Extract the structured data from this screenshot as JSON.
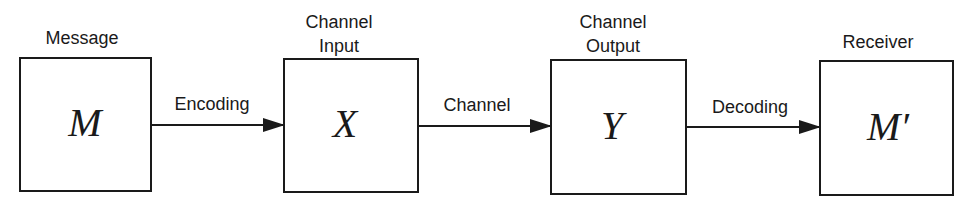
{
  "diagram": {
    "blocks": [
      {
        "label_line1": "Message",
        "label_line2": "",
        "symbol": "M"
      },
      {
        "label_line1": "Channel",
        "label_line2": "Input",
        "symbol": "X"
      },
      {
        "label_line1": "Channel",
        "label_line2": "Output",
        "symbol": "Y"
      },
      {
        "label_line1": "Receiver",
        "label_line2": "",
        "symbol": "M′"
      }
    ],
    "arrows": [
      {
        "label": "Encoding",
        "from": "M",
        "to": "X"
      },
      {
        "label": "Channel",
        "from": "X",
        "to": "Y"
      },
      {
        "label": "Decoding",
        "from": "Y",
        "to": "M′"
      }
    ],
    "colors": {
      "stroke": "#1a1a1a",
      "background": "#ffffff"
    }
  }
}
